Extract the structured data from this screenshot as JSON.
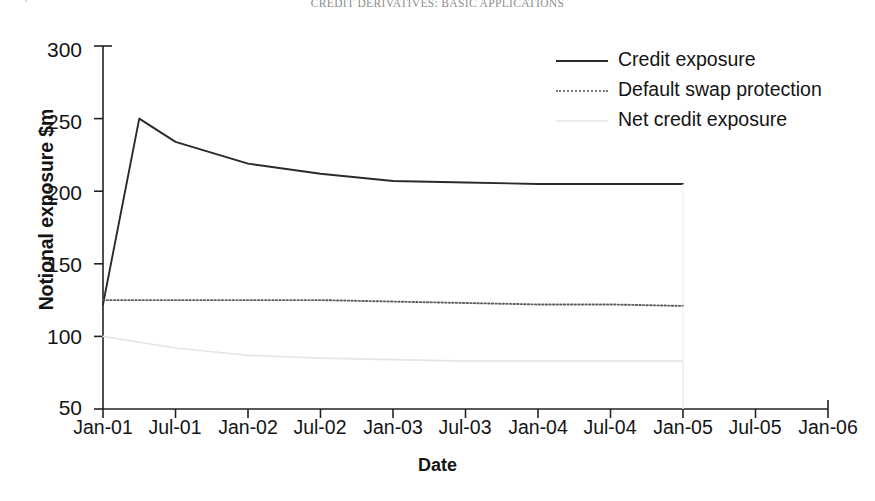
{
  "page": {
    "running_head": "CREDIT DERIVATIVES: BASIC APPLICATIONS",
    "page_number": "4"
  },
  "chart_data": {
    "type": "line",
    "title": "",
    "xlabel": "Date",
    "ylabel": "Notional exposure $m",
    "grid": false,
    "legend_position": "top-right",
    "xlim": [
      "Jan-01",
      "Jan-06"
    ],
    "ylim": [
      50,
      300
    ],
    "yticks": [
      50,
      100,
      150,
      200,
      250,
      300
    ],
    "ytick_labels": [
      "50",
      "100",
      "150",
      "200",
      "250",
      "300"
    ],
    "categories": [
      "Jan-01",
      "Jul-01",
      "Jan-02",
      "Jul-02",
      "Jan-03",
      "Jul-03",
      "Jan-04",
      "Jul-04",
      "Jan-05",
      "Jul-05",
      "Jan-06"
    ],
    "xtick_labels": [
      "Jan-01",
      "Jul-01",
      "Jan-02",
      "Jul-02",
      "Jan-03",
      "Jul-03",
      "Jan-04",
      "Jul-04",
      "Jan-05",
      "Jul-05",
      "Jan-06"
    ],
    "series": [
      {
        "name": "Credit exposure",
        "style": "solid",
        "color": "#2a2a2a",
        "x": [
          "Jan-01",
          "Apr-01",
          "Jul-01",
          "Jan-02",
          "Jul-02",
          "Jan-03",
          "Jul-03",
          "Jan-04",
          "Jul-04",
          "Jan-05"
        ],
        "values": [
          122,
          250,
          234,
          219,
          212,
          207,
          206,
          205,
          205,
          205
        ]
      },
      {
        "name": "Default swap protection",
        "style": "dotted",
        "color": "#5e5e5e",
        "x": [
          "Jan-01",
          "Jul-01",
          "Jan-02",
          "Jul-02",
          "Jan-03",
          "Jul-03",
          "Jan-04",
          "Jul-04",
          "Jan-05"
        ],
        "values": [
          125,
          125,
          125,
          125,
          124,
          123,
          122,
          122,
          121
        ]
      },
      {
        "name": "Net credit exposure",
        "style": "faint-solid",
        "color": "#e4e4e4",
        "x": [
          "Jan-01",
          "Jul-01",
          "Jan-02",
          "Jul-02",
          "Jan-03",
          "Jul-03",
          "Jan-04",
          "Jul-04",
          "Jan-05"
        ],
        "values": [
          100,
          92,
          87,
          85,
          84,
          83,
          83,
          83,
          83
        ]
      }
    ],
    "legend_entries": [
      "Credit exposure",
      "Default swap protection",
      "Net credit exposure"
    ]
  }
}
